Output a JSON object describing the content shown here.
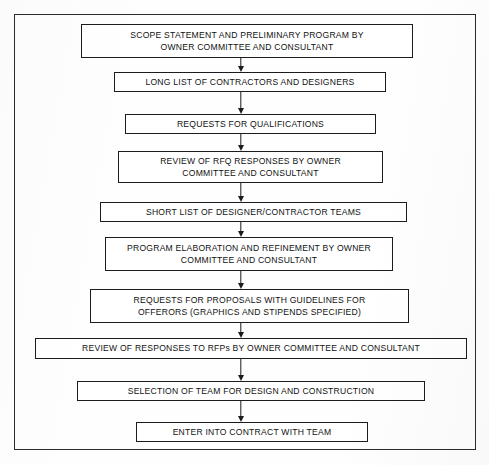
{
  "figure": {
    "frame": {
      "border_color": "#2b2b2b"
    },
    "node_style": {
      "border_color": "#1c1c1c",
      "fill": "#ffffff",
      "text_color": "#111111"
    },
    "connector_style": {
      "color": "#1c1c1c",
      "arrowhead": "down-arrow-icon"
    }
  },
  "flow": {
    "nodes": [
      {
        "id": "scope-statement",
        "text": "SCOPE STATEMENT AND PRELIMINARY PROGRAM BY\nOWNER COMMITTEE AND CONSULTANT",
        "x": 80,
        "y": 23,
        "width": 332,
        "height": 34
      },
      {
        "id": "long-list",
        "text": "LONG LIST OF CONTRACTORS AND DESIGNERS",
        "x": 113,
        "y": 71,
        "width": 272,
        "height": 20
      },
      {
        "id": "requests-for-qualifications",
        "text": "REQUESTS FOR QUALIFICATIONS",
        "x": 124,
        "y": 113,
        "width": 251,
        "height": 20
      },
      {
        "id": "review-rfq-responses",
        "text": "REVIEW OF RFQ RESPONSES BY OWNER\nCOMMITTEE AND CONSULTANT",
        "x": 117,
        "y": 150,
        "width": 265,
        "height": 32
      },
      {
        "id": "short-list",
        "text": "SHORT LIST OF DESIGNER/CONTRACTOR TEAMS",
        "x": 99,
        "y": 201,
        "width": 307,
        "height": 20
      },
      {
        "id": "program-elaboration",
        "text": "PROGRAM ELABORATION AND REFINEMENT BY OWNER\nCOMMITTEE AND CONSULTANT",
        "x": 104,
        "y": 236,
        "width": 288,
        "height": 34
      },
      {
        "id": "requests-for-proposals",
        "text": "REQUESTS FOR PROPOSALS WITH GUIDELINES FOR\nOFFERORS (GRAPHICS AND STIPENDS SPECIFIED)",
        "x": 89,
        "y": 288,
        "width": 319,
        "height": 34
      },
      {
        "id": "review-rfp-responses",
        "text": "REVIEW OF RESPONSES TO RFPs BY OWNER COMMITTEE AND CONSULTANT",
        "x": 34,
        "y": 337,
        "width": 432,
        "height": 21
      },
      {
        "id": "selection-of-team",
        "text": "SELECTION OF TEAM FOR DESIGN AND CONSTRUCTION",
        "x": 76,
        "y": 380,
        "width": 348,
        "height": 20
      },
      {
        "id": "enter-into-contract",
        "text": "ENTER INTO CONTRACT WITH TEAM",
        "x": 135,
        "y": 421,
        "width": 232,
        "height": 20
      }
    ],
    "connectors": [
      {
        "id": "arrow-1",
        "from": "scope-statement",
        "to": "long-list",
        "x": 240,
        "y": 57,
        "height": 14
      },
      {
        "id": "arrow-2",
        "from": "long-list",
        "to": "requests-for-qualifications",
        "x": 240,
        "y": 91,
        "height": 22
      },
      {
        "id": "arrow-3",
        "from": "requests-for-qualifications",
        "to": "review-rfq-responses",
        "x": 240,
        "y": 133,
        "height": 17
      },
      {
        "id": "arrow-4",
        "from": "review-rfq-responses",
        "to": "short-list",
        "x": 240,
        "y": 182,
        "height": 19
      },
      {
        "id": "arrow-5",
        "from": "short-list",
        "to": "program-elaboration",
        "x": 240,
        "y": 221,
        "height": 15
      },
      {
        "id": "arrow-6",
        "from": "program-elaboration",
        "to": "requests-for-proposals",
        "x": 240,
        "y": 270,
        "height": 18
      },
      {
        "id": "arrow-7",
        "from": "requests-for-proposals",
        "to": "review-rfp-responses",
        "x": 240,
        "y": 322,
        "height": 15
      },
      {
        "id": "arrow-8",
        "from": "review-rfp-responses",
        "to": "selection-of-team",
        "x": 240,
        "y": 358,
        "height": 22
      },
      {
        "id": "arrow-9",
        "from": "selection-of-team",
        "to": "enter-into-contract",
        "x": 240,
        "y": 400,
        "height": 21
      }
    ]
  }
}
